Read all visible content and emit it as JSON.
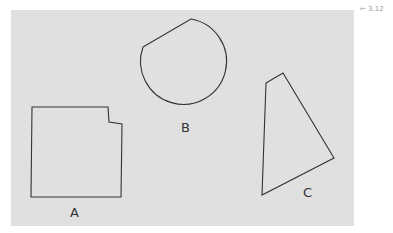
{
  "figure": {
    "background_panel_color": "#e0e0e0",
    "stroke_color": "#333333",
    "annotation": {
      "arrow": "←",
      "text": "3.12"
    },
    "shapes": [
      {
        "id": "A",
        "label": "A",
        "type": "polygon",
        "points": "32,107 108,107 109,122 122,124 121,197 31,197"
      },
      {
        "id": "B",
        "label": "B",
        "type": "circular-segment",
        "path": "M143,47 L191,19 A43,43 0 1,1 143,47 Z"
      },
      {
        "id": "C",
        "label": "C",
        "type": "quadrilateral",
        "points": "266,83 283,73 334,158 262,195"
      }
    ]
  }
}
